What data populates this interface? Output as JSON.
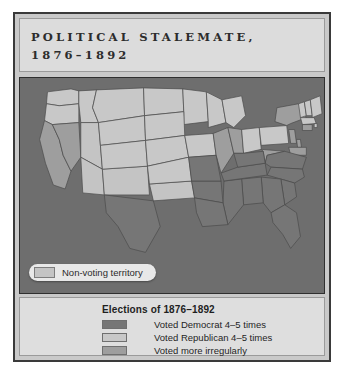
{
  "figure": {
    "title": "POLITICAL STALEMATE,\n1876–1892"
  },
  "map": {
    "nonvoting": {
      "label": "Non-voting territory",
      "swatch_color": "#c4c4c4"
    },
    "background_color": "#6e6e6e",
    "border_color": "#4a4a4a",
    "regions": [
      {
        "state": "WA",
        "category": "republican"
      },
      {
        "state": "OR",
        "category": "republican"
      },
      {
        "state": "ID",
        "category": "republican"
      },
      {
        "state": "MT",
        "category": "republican"
      },
      {
        "state": "ND",
        "category": "republican"
      },
      {
        "state": "MN",
        "category": "republican"
      },
      {
        "state": "WI",
        "category": "republican"
      },
      {
        "state": "MI",
        "category": "republican"
      },
      {
        "state": "CA",
        "category": "irregular"
      },
      {
        "state": "NV",
        "category": "irregular"
      },
      {
        "state": "UT",
        "category": "nonvoting"
      },
      {
        "state": "AZ",
        "category": "nonvoting"
      },
      {
        "state": "NM",
        "category": "nonvoting"
      },
      {
        "state": "OK",
        "category": "nonvoting"
      },
      {
        "state": "WY",
        "category": "republican"
      },
      {
        "state": "CO",
        "category": "republican"
      },
      {
        "state": "SD",
        "category": "republican"
      },
      {
        "state": "NE",
        "category": "republican"
      },
      {
        "state": "KS",
        "category": "republican"
      },
      {
        "state": "IA",
        "category": "republican"
      },
      {
        "state": "IL",
        "category": "irregular"
      },
      {
        "state": "IN",
        "category": "irregular"
      },
      {
        "state": "OH",
        "category": "republican"
      },
      {
        "state": "PA",
        "category": "republican"
      },
      {
        "state": "NY",
        "category": "irregular"
      },
      {
        "state": "VT",
        "category": "republican"
      },
      {
        "state": "NH",
        "category": "republican"
      },
      {
        "state": "ME",
        "category": "republican"
      },
      {
        "state": "MA",
        "category": "republican"
      },
      {
        "state": "CT",
        "category": "irregular"
      },
      {
        "state": "RI",
        "category": "republican"
      },
      {
        "state": "NJ",
        "category": "irregular"
      },
      {
        "state": "DE",
        "category": "irregular"
      },
      {
        "state": "MD",
        "category": "irregular"
      },
      {
        "state": "WV",
        "category": "irregular"
      },
      {
        "state": "VA",
        "category": "democrat"
      },
      {
        "state": "NC",
        "category": "democrat"
      },
      {
        "state": "SC",
        "category": "democrat"
      },
      {
        "state": "GA",
        "category": "democrat"
      },
      {
        "state": "FL",
        "category": "democrat"
      },
      {
        "state": "AL",
        "category": "democrat"
      },
      {
        "state": "MS",
        "category": "democrat"
      },
      {
        "state": "TN",
        "category": "democrat"
      },
      {
        "state": "KY",
        "category": "democrat"
      },
      {
        "state": "AR",
        "category": "democrat"
      },
      {
        "state": "LA",
        "category": "democrat"
      },
      {
        "state": "MO",
        "category": "democrat"
      },
      {
        "state": "TX",
        "category": "democrat"
      }
    ]
  },
  "legend": {
    "heading": "Elections of 1876–1892",
    "items": [
      {
        "label": "Voted Democrat 4–5 times",
        "color": "#767676"
      },
      {
        "label": "Voted Republican 4–5 times",
        "color": "#c8c8c8"
      },
      {
        "label": "Voted more irregularly",
        "color": "#9e9e9e"
      }
    ]
  },
  "palette": {
    "democrat": "#767676",
    "republican": "#c8c8c8",
    "irregular": "#9e9e9e",
    "nonvoting": "#c4c4c4"
  }
}
